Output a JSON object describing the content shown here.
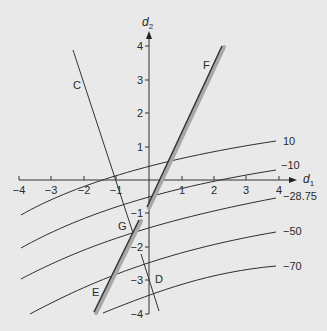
{
  "diagram": {
    "x_axis": {
      "title": "d",
      "subscript": "1",
      "ticks": [
        {
          "value": -4,
          "label": "−4",
          "px": 19
        },
        {
          "value": -3,
          "label": "−3",
          "px": 51
        },
        {
          "value": -2,
          "label": "−2",
          "px": 84
        },
        {
          "value": -1,
          "label": "−1",
          "px": 116
        },
        {
          "value": 1,
          "label": "1",
          "px": 182
        },
        {
          "value": 2,
          "label": "2",
          "px": 214
        },
        {
          "value": 3,
          "label": "3",
          "px": 246
        },
        {
          "value": 4,
          "label": "4",
          "px": 279
        }
      ]
    },
    "y_axis": {
      "title": "d",
      "subscript": "2",
      "ticks": [
        {
          "value": 4,
          "label": "4",
          "py": 46
        },
        {
          "value": 3,
          "label": "3",
          "py": 80
        },
        {
          "value": 2,
          "label": "2",
          "py": 113
        },
        {
          "value": 1,
          "label": "1",
          "py": 147
        },
        {
          "value": -1,
          "label": "−1",
          "py": 213
        },
        {
          "value": -2,
          "label": "−2",
          "py": 247
        },
        {
          "value": -3,
          "label": "−3",
          "py": 280
        },
        {
          "value": -4,
          "label": "−4",
          "py": 314
        }
      ]
    },
    "contours": [
      {
        "label": "10",
        "path": "M 21 215 C 70 187, 150 160, 276 141",
        "label_x": 283,
        "label_y": 145
      },
      {
        "label": "−10",
        "path": "M 21 248 C 75 218, 150 190, 276 170",
        "label_x": 281,
        "label_y": 169
      },
      {
        "label": "−28.75",
        "path": "M 21 279 C 80 248, 150 222, 276 198",
        "label_x": 283,
        "label_y": 200
      },
      {
        "label": "−50",
        "path": "M 30 314 C 90 282, 160 252, 276 232",
        "label_x": 283,
        "label_y": 235
      },
      {
        "label": "−70",
        "path": "M 103 313 C 160 290, 210 272, 276 266",
        "label_x": 283,
        "label_y": 270
      }
    ],
    "lines": [
      {
        "label": "C",
        "x1": 73,
        "y1": 50,
        "x2": 134,
        "y2": 236,
        "label_x": 73,
        "label_y": 89,
        "thick": false
      },
      {
        "label": "D",
        "x1": 141,
        "y1": 254,
        "x2": 159,
        "y2": 311,
        "label_x": 155,
        "label_y": 283,
        "thick": false
      },
      {
        "label": "F",
        "x1": 147,
        "y1": 207,
        "x2": 222,
        "y2": 46,
        "label_x": 203,
        "label_y": 69,
        "thick": true
      },
      {
        "label": "E",
        "x1": 94,
        "y1": 312,
        "x2": 139,
        "y2": 220,
        "label_x": 92,
        "label_y": 296,
        "thick": true
      }
    ],
    "points": [
      {
        "label": "G",
        "label_x": 118,
        "label_y": 230
      }
    ]
  }
}
